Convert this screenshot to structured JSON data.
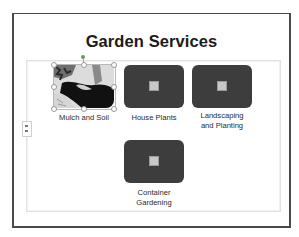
{
  "slide": {
    "title": "Garden Services"
  },
  "smartart": {
    "items": [
      {
        "label": "Mulch and Soil",
        "type": "picture",
        "selected": true
      },
      {
        "label": "House Plants",
        "type": "placeholder",
        "icon": "picture-placeholder-icon"
      },
      {
        "label_line1": "Landscaping",
        "label_line2": "and Planting",
        "type": "placeholder",
        "icon": "picture-placeholder-icon"
      },
      {
        "label_line1": "Container",
        "label_line2": "Gardening",
        "type": "placeholder",
        "icon": "picture-placeholder-icon"
      }
    ],
    "text_pane_handle": "expand-text-pane"
  },
  "colors": {
    "shape_fill": "#3d3d3d",
    "slide_border": "#4a4a4a",
    "title_text": "#1b1b1b",
    "rotation_handle": "#6a9b55"
  }
}
